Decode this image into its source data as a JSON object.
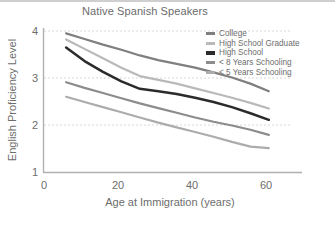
{
  "chart_data": {
    "type": "line",
    "title": "Native Spanish Speakers",
    "xlabel": "Age at Immigration (years)",
    "ylabel": "English Proficiency Level",
    "xlim": [
      0,
      70
    ],
    "ylim": [
      1,
      4
    ],
    "xticks": [
      "0",
      "20",
      "40",
      "60"
    ],
    "xtick_values": [
      0,
      20,
      40,
      60
    ],
    "yticks": [
      "1",
      "2",
      "3",
      "4"
    ],
    "ytick_values": [
      1,
      2,
      3,
      4
    ],
    "grid": "horizontal-dotted at y=2,3,4",
    "legend_position": "top-right inside",
    "x": [
      6,
      11,
      16,
      21,
      26,
      31,
      36,
      41,
      46,
      51,
      56,
      61
    ],
    "series": [
      {
        "name": "College",
        "color": "#7f7f7f",
        "values": [
          3.95,
          3.83,
          3.71,
          3.6,
          3.48,
          3.38,
          3.3,
          3.22,
          3.12,
          3.01,
          2.88,
          2.72
        ]
      },
      {
        "name": "High School Graduate",
        "color": "#b9b9b9",
        "values": [
          3.82,
          3.62,
          3.42,
          3.22,
          3.04,
          2.96,
          2.88,
          2.78,
          2.68,
          2.58,
          2.47,
          2.35
        ]
      },
      {
        "name": "High School",
        "color": "#2b2b2b",
        "values": [
          3.65,
          3.36,
          3.13,
          2.93,
          2.77,
          2.72,
          2.66,
          2.58,
          2.49,
          2.38,
          2.25,
          2.11
        ]
      },
      {
        "name": "< 8 Years Schooling",
        "color": "#8c8c8c",
        "values": [
          2.91,
          2.79,
          2.68,
          2.57,
          2.46,
          2.36,
          2.26,
          2.16,
          2.07,
          1.99,
          1.9,
          1.79
        ]
      },
      {
        "name": "< 5 Years Schooling",
        "color": "#acacac",
        "values": [
          2.6,
          2.49,
          2.38,
          2.27,
          2.16,
          2.05,
          1.95,
          1.85,
          1.75,
          1.64,
          1.54,
          1.51
        ]
      }
    ]
  },
  "legend": {
    "items": [
      {
        "label": "College",
        "color": "#7f7f7f"
      },
      {
        "label": "High School Graduate",
        "color": "#b9b9b9"
      },
      {
        "label": "High School",
        "color": "#2b2b2b"
      },
      {
        "label": "< 8 Years Schooling",
        "color": "#8c8c8c"
      },
      {
        "label": "< 5 Years Schooling",
        "color": "#acacac"
      }
    ]
  },
  "colors": {
    "axis": "#b0b0b0",
    "grid": "#d8d8d8",
    "text": "#6d6d6d",
    "background": "#ffffff"
  }
}
